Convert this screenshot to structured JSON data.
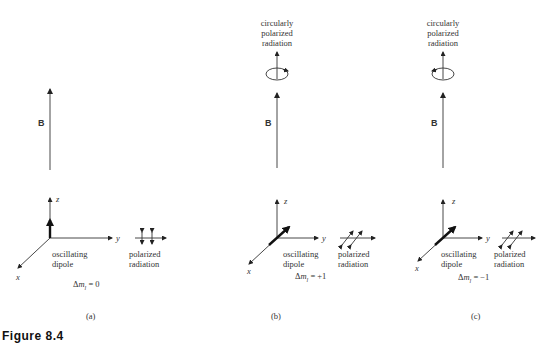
{
  "figure": {
    "caption": "Figure 8.4",
    "panels": [
      {
        "id": "a",
        "label": "(a)",
        "field_label": "B",
        "axis_labels": {
          "x": "x",
          "y": "y",
          "z": "z"
        },
        "dipole_label_line1": "oscillating",
        "dipole_label_line2": "dipole",
        "radiation_label_line1": "polarized",
        "radiation_label_line2": "radiation",
        "delta_m": "Δmₗ = 0",
        "delta_m_prefix": "Δ",
        "delta_m_var": "m",
        "delta_m_sub": "l",
        "delta_m_value": " = 0",
        "top_label": null
      },
      {
        "id": "b",
        "label": "(b)",
        "field_label": "B",
        "axis_labels": {
          "x": "x",
          "y": "y",
          "z": "z"
        },
        "dipole_label_line1": "oscillating",
        "dipole_label_line2": "dipole",
        "radiation_label_line1": "polarized",
        "radiation_label_line2": "radiation",
        "delta_m_prefix": "Δ",
        "delta_m_var": "m",
        "delta_m_sub": "l",
        "delta_m_value": " = +1",
        "top_label_line1": "circularly",
        "top_label_line2": "polarized",
        "top_label_line3": "radiation"
      },
      {
        "id": "c",
        "label": "(c)",
        "field_label": "B",
        "axis_labels": {
          "x": "x",
          "y": "y",
          "z": "z"
        },
        "dipole_label_line1": "oscillating",
        "dipole_label_line2": "dipole",
        "radiation_label_line1": "polarized",
        "radiation_label_line2": "radiation",
        "delta_m_prefix": "Δ",
        "delta_m_var": "m",
        "delta_m_sub": "l",
        "delta_m_value": " = −1",
        "top_label_line1": "circularly",
        "top_label_line2": "polarized",
        "top_label_line3": "radiation"
      }
    ],
    "colors": {
      "ink": "#222222",
      "background": "#ffffff"
    }
  }
}
